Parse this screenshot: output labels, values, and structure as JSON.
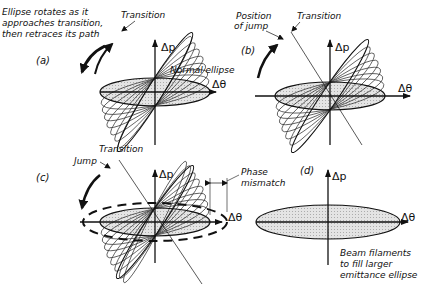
{
  "figure": {
    "panels": [
      {
        "id": "a",
        "label": "(a)",
        "axis_x": "Δθ",
        "axis_y": "Δp",
        "annotations": {
          "caption_line1": "Ellipse rotates as it",
          "caption_line2": "approaches transition,",
          "caption_line3": "then retraces its path",
          "transition": "Transition",
          "normal_ellipse": "Normal ellipse"
        }
      },
      {
        "id": "b",
        "label": "(b)",
        "axis_x": "Δθ",
        "axis_y": "Δp",
        "annotations": {
          "position_of_jump_line1": "Position",
          "position_of_jump_line2": "of jump",
          "transition": "Transition"
        }
      },
      {
        "id": "c",
        "label": "(c)",
        "axis_x": "Δθ",
        "axis_y": "Δp",
        "annotations": {
          "transition": "Transition",
          "jump": "Jump",
          "phase_mismatch_line1": "Phase",
          "phase_mismatch_line2": "mismatch"
        }
      },
      {
        "id": "d",
        "label": "(d)",
        "axis_x": "Δθ",
        "axis_y": "Δp",
        "annotations": {
          "caption_line1": "Beam filaments",
          "caption_line2": "to fill larger",
          "caption_line3": "emittance ellipse"
        }
      }
    ],
    "colors": {
      "ink": "#111111",
      "fill": "#d9d9d9",
      "background": "#ffffff"
    }
  }
}
